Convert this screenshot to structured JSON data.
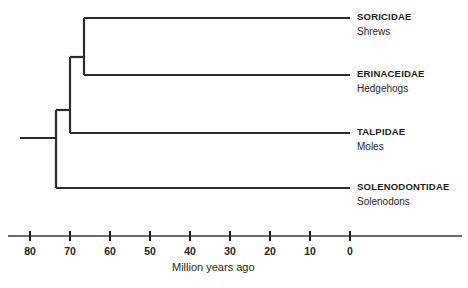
{
  "diagram": {
    "type": "phylogenetic-tree-cladogram",
    "colors": {
      "branch": "#2b2b2b",
      "axis": "#3a3a3a",
      "family_text": "#1a1a1a",
      "common_text": "#262626",
      "background": "#ffffff"
    },
    "tips": [
      {
        "family": "SORICIDAE",
        "common": "Shrews"
      },
      {
        "family": "ERINACEIDAE",
        "common": "Hedgehogs"
      },
      {
        "family": "TALPIDAE",
        "common": "Moles"
      },
      {
        "family": "SOLENODONTIDAE",
        "common": "Solenodons"
      }
    ],
    "nodes": [
      {
        "name": "root-node",
        "age_mya": 73.5,
        "children": [
          "solenodontidae",
          "eulipotyphla-core"
        ]
      },
      {
        "name": "eulipotyphla-core-node",
        "age_mya": 70,
        "children": [
          "talpidae",
          "soricidae-erinaceidae"
        ]
      },
      {
        "name": "soricidae-erinaceidae-node",
        "age_mya": 66.5,
        "children": [
          "soricidae",
          "erinaceidae"
        ]
      }
    ],
    "axis": {
      "title": "Million years ago",
      "ticks": [
        "80",
        "70",
        "60",
        "50",
        "40",
        "30",
        "20",
        "10",
        "0"
      ],
      "tick_values": [
        80,
        70,
        60,
        50,
        40,
        30,
        20,
        10,
        0
      ],
      "direction": "reversed"
    }
  }
}
